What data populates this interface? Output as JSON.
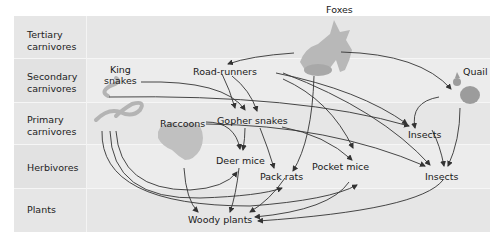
{
  "diagram": {
    "type": "food-web",
    "levels": [
      {
        "id": "tertiary",
        "label_line1": "Tertiary",
        "label_line2": "carnivores"
      },
      {
        "id": "secondary",
        "label_line1": "Secondary",
        "label_line2": "carnivores"
      },
      {
        "id": "primary",
        "label_line1": "Primary",
        "label_line2": "carnivores"
      },
      {
        "id": "herbivores",
        "label_line1": "Herbivores",
        "label_line2": ""
      },
      {
        "id": "plants",
        "label_line1": "Plants",
        "label_line2": ""
      }
    ],
    "nodes": {
      "foxes": "Foxes",
      "king_snakes_1": "King",
      "king_snakes_2": "snakes",
      "road_runners": "Road-runners",
      "quail": "Quail",
      "raccoons": "Raccoons",
      "gopher_snakes": "Gopher snakes",
      "insects_primary": "Insects",
      "deer_mice": "Deer mice",
      "pack_rats": "Pack rats",
      "pocket_mice": "Pocket mice",
      "insects_herb": "Insects",
      "woody_plants": "Woody plants"
    },
    "edges": [
      [
        "foxes",
        "road_runners"
      ],
      [
        "foxes",
        "quail"
      ],
      [
        "foxes",
        "pack_rats"
      ],
      [
        "king_snakes",
        "gopher_snakes"
      ],
      [
        "king_snakes",
        "insects_primary"
      ],
      [
        "king_snakes",
        "deer_mice"
      ],
      [
        "king_snakes",
        "pack_rats"
      ],
      [
        "king_snakes",
        "pocket_mice"
      ],
      [
        "road_runners",
        "gopher_snakes"
      ],
      [
        "road_runners",
        "insects_primary"
      ],
      [
        "road_runners",
        "insects_herb"
      ],
      [
        "road_runners",
        "pocket_mice"
      ],
      [
        "quail",
        "insects_primary"
      ],
      [
        "quail",
        "insects_herb"
      ],
      [
        "raccoons",
        "deer_mice"
      ],
      [
        "raccoons",
        "insects_herb"
      ],
      [
        "raccoons",
        "woody_plants"
      ],
      [
        "gopher_snakes",
        "deer_mice"
      ],
      [
        "gopher_snakes",
        "pack_rats"
      ],
      [
        "gopher_snakes",
        "pocket_mice"
      ],
      [
        "insects_primary",
        "insects_herb"
      ],
      [
        "deer_mice",
        "woody_plants"
      ],
      [
        "pack_rats",
        "woody_plants"
      ],
      [
        "pocket_mice",
        "woody_plants"
      ],
      [
        "insects_herb",
        "woody_plants"
      ]
    ]
  }
}
